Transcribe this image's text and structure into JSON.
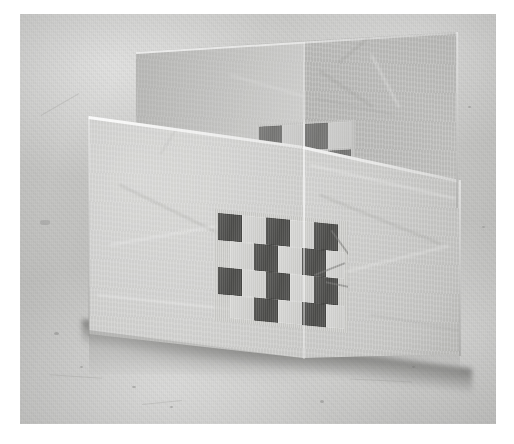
{
  "photo": {
    "subject": "folded translucent paper card standing upright on a textured surface",
    "orientation": "landscape",
    "frame": {
      "border_color": "#ffffff",
      "border_width_px": 20
    },
    "canvas": {
      "width": 514,
      "height": 444
    },
    "image_area": {
      "x": 20,
      "y": 14,
      "width": 476,
      "height": 410
    }
  },
  "scene": {
    "background_label": "mottled gray concrete surface",
    "background_color": "#c6c6c4",
    "background_highlight": "#d4d4d2",
    "background_shadow": "#b4b4b2",
    "floor_shadow_color": "#5a5a58"
  },
  "card": {
    "label": "zig-zag folded paper card",
    "material": "translucent vellum paper",
    "paper_color_light": "#cdcdcb",
    "paper_color_mid": "#c4c4c2",
    "paper_color_shade": "#b4b4b2",
    "crease_highlight": "#ffffff",
    "panels": [
      {
        "name": "rear-panel",
        "label": "rear leaf (upper left to upper right)"
      },
      {
        "name": "middle-panel",
        "label": "back wall panel seen behind the front fold"
      },
      {
        "name": "front-left-panel",
        "label": "front leaf, left half"
      },
      {
        "name": "front-right-panel",
        "label": "front leaf, right half"
      }
    ],
    "folds": [
      {
        "name": "top-rear-crease",
        "label": "top edge crease of rear leaf"
      },
      {
        "name": "horizontal-crease",
        "label": "horizontal fold across the front leaf"
      },
      {
        "name": "vertical-crease",
        "label": "central vertical valley fold"
      }
    ]
  },
  "patterns": {
    "front_weave": {
      "label": "woven checkerboard window (front panel)",
      "style": "offset brick checkerboard",
      "dark_color": "#545452",
      "light_color": "#d2d2d0",
      "mat_color": "#cdcdcb",
      "columns": 5,
      "rows": 4,
      "cell_width_px": 24,
      "cell_height_px": 27,
      "row_offsets_px": [
        0,
        12,
        0,
        12
      ],
      "grid": [
        [
          1,
          0,
          1,
          0,
          1
        ],
        [
          0,
          1,
          0,
          1,
          0
        ],
        [
          1,
          0,
          1,
          0,
          1
        ],
        [
          0,
          1,
          0,
          1,
          0
        ]
      ],
      "tape_strips": 3
    },
    "rear_weave": {
      "label": "woven checkerboard window (rear panel, partly hidden)",
      "style": "offset brick checkerboard",
      "dark_color": "#5a5a58",
      "light_color": "#c9c9c7",
      "columns": 4,
      "rows": 2,
      "cell_width_px": 23,
      "cell_height_px": 26,
      "visible_fraction": 0.35,
      "grid": [
        [
          1,
          0,
          1,
          0
        ],
        [
          0,
          1,
          0,
          1
        ]
      ]
    }
  }
}
